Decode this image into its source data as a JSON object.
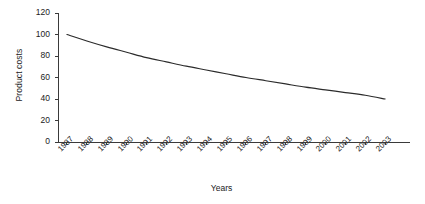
{
  "chart_data": {
    "type": "line",
    "title": "",
    "xlabel": "Years",
    "ylabel": "Product costs",
    "x": [
      "1987",
      "1988",
      "1989",
      "1990",
      "1991",
      "1992",
      "1993",
      "1994",
      "1995",
      "1996",
      "1997",
      "1998",
      "1999",
      "2000",
      "2001",
      "2002",
      "2003"
    ],
    "values": [
      100,
      94,
      88.5,
      83.5,
      78.5,
      74.5,
      70.5,
      67,
      63.5,
      60,
      57,
      54,
      51,
      48.5,
      46,
      43.5,
      40
    ],
    "ylim": [
      0,
      120
    ],
    "yticks": [
      0,
      20,
      40,
      60,
      80,
      100,
      120
    ],
    "ytick_labels": [
      "0",
      "20",
      "40",
      "60",
      "80",
      "100",
      "120"
    ],
    "grid": false,
    "legend": false,
    "series": [
      {
        "name": "Product costs",
        "color": "#2b2b2b",
        "values": [
          100,
          94,
          88.5,
          83.5,
          78.5,
          74.5,
          70.5,
          67,
          63.5,
          60,
          57,
          54,
          51,
          48.5,
          46,
          43.5,
          40
        ]
      }
    ]
  },
  "axes": {
    "y_title": "Product costs",
    "x_title": "Years"
  },
  "colors": {
    "background": "#ffffff",
    "axis": "#3a3a3a",
    "line": "#2b2b2b",
    "text": "#222222"
  }
}
